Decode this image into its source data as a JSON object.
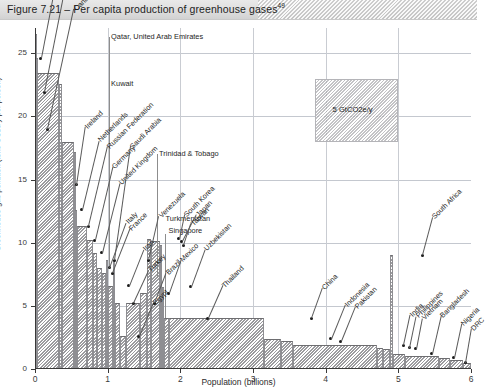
{
  "figure": {
    "title_prefix": "Figure 7.21",
    "title": "Figure 7.21 – Per capita production of greenhouse gases",
    "footnote_marker": "49"
  },
  "axes": {
    "x_title": "Population (billions)",
    "y_title": "Greenhouse-gas pollution (tons CO2e/y per person)",
    "x_ticks": [
      "0",
      "1",
      "2",
      "3",
      "4",
      "5",
      "6"
    ],
    "y_ticks": [
      "0",
      "5",
      "10",
      "15",
      "20",
      "25"
    ],
    "xlim": [
      0,
      6
    ],
    "ylim": [
      0,
      27
    ]
  },
  "annotation_box": {
    "label": "5 GtCO2e/y",
    "x_start": 3.85,
    "x_end": 5.0,
    "y_bottom": 18.0,
    "y_top": 23.0
  },
  "top_labels": [
    {
      "text": "Qatar, United Arab Emirates",
      "x": 1.02,
      "y": 26.3
    },
    {
      "text": "Kuwait",
      "x": 1.02,
      "y": 22.6
    },
    {
      "text": "Trinidad & Tobago",
      "x": 1.68,
      "y": 17.0
    },
    {
      "text": "Turkmenistan",
      "x": 1.77,
      "y": 11.9
    },
    {
      "text": "Singapore",
      "x": 1.81,
      "y": 10.9
    }
  ],
  "callouts": [
    {
      "name": "Australia",
      "x": 0.08,
      "y": 24.6,
      "tx": 0.36,
      "ty": 33.0
    },
    {
      "name": "United States of America",
      "x": 0.13,
      "y": 21.9,
      "tx": 0.46,
      "ty": 31.5
    },
    {
      "name": "Canada",
      "x": 0.17,
      "y": 19.0,
      "tx": 0.53,
      "ty": 28.5
    },
    {
      "name": "Ireland",
      "x": 0.57,
      "y": 14.6,
      "tx": 0.69,
      "ty": 19.2
    },
    {
      "name": "Netherlands",
      "x": 0.64,
      "y": 12.6,
      "tx": 0.87,
      "ty": 18.1
    },
    {
      "name": "Russian Federation",
      "x": 0.73,
      "y": 11.3,
      "tx": 0.99,
      "ty": 17.6
    },
    {
      "name": "Germany",
      "x": 0.82,
      "y": 10.2,
      "tx": 1.06,
      "ty": 16.0
    },
    {
      "name": "United Kingdom",
      "x": 0.92,
      "y": 9.2,
      "tx": 1.16,
      "ty": 14.7
    },
    {
      "name": "Saudi Arabia",
      "x": 1.09,
      "y": 8.6,
      "tx": 1.31,
      "ty": 17.6
    },
    {
      "name": "Italy",
      "x": 1.02,
      "y": 8.0,
      "tx": 1.25,
      "ty": 11.6
    },
    {
      "name": "France",
      "x": 1.06,
      "y": 7.6,
      "tx": 1.3,
      "ty": 11.1
    },
    {
      "name": "Iran",
      "x": 1.29,
      "y": 6.6,
      "tx": 1.49,
      "ty": 9.5
    },
    {
      "name": "Turkey",
      "x": 1.35,
      "y": 5.2,
      "tx": 1.56,
      "ty": 7.8
    },
    {
      "name": "Egypt",
      "x": 1.43,
      "y": 2.6,
      "tx": 1.62,
      "ty": 5.2
    },
    {
      "name": "Venezuela",
      "x": 1.56,
      "y": 8.6,
      "tx": 1.7,
      "ty": 12.1
    },
    {
      "name": "Brazil",
      "x": 1.64,
      "y": 5.2,
      "tx": 1.8,
      "ty": 7.6
    },
    {
      "name": "Mexico",
      "x": 1.84,
      "y": 6.0,
      "tx": 2.0,
      "ty": 8.6
    },
    {
      "name": "South Korea",
      "x": 1.98,
      "y": 10.3,
      "tx": 2.05,
      "ty": 12.2
    },
    {
      "name": "Japan",
      "x": 2.02,
      "y": 10.1,
      "tx": 2.21,
      "ty": 12.2
    },
    {
      "name": "Taiwan",
      "x": 2.04,
      "y": 9.8,
      "tx": 2.14,
      "ty": 11.5
    },
    {
      "name": "Uzbekistan",
      "x": 2.14,
      "y": 6.5,
      "tx": 2.33,
      "ty": 9.5
    },
    {
      "name": "Thailand",
      "x": 2.38,
      "y": 4.0,
      "tx": 2.58,
      "ty": 6.6
    },
    {
      "name": "China",
      "x": 3.8,
      "y": 4.0,
      "tx": 3.95,
      "ty": 6.4
    },
    {
      "name": "Indonesia",
      "x": 4.07,
      "y": 2.4,
      "tx": 4.26,
      "ty": 5.1
    },
    {
      "name": "Pakistan",
      "x": 4.21,
      "y": 2.2,
      "tx": 4.4,
      "ty": 4.9
    },
    {
      "name": "South Africa",
      "x": 5.33,
      "y": 9.0,
      "tx": 5.47,
      "ty": 12.0
    },
    {
      "name": "India",
      "x": 5.07,
      "y": 1.9,
      "tx": 5.16,
      "ty": 4.3
    },
    {
      "name": "Philippines",
      "x": 5.15,
      "y": 1.7,
      "tx": 5.24,
      "ty": 4.2
    },
    {
      "name": "Vietnam",
      "x": 5.24,
      "y": 1.6,
      "tx": 5.32,
      "ty": 4.0
    },
    {
      "name": "Bangladesh",
      "x": 5.46,
      "y": 1.2,
      "tx": 5.58,
      "ty": 4.2
    },
    {
      "name": "Nigeria",
      "x": 5.76,
      "y": 0.9,
      "tx": 5.86,
      "ty": 3.6
    },
    {
      "name": "DRC",
      "x": 5.92,
      "y": 0.5,
      "tx": 6.0,
      "ty": 3.2
    }
  ],
  "chart_data": {
    "type": "bar",
    "title": "Figure 7.21 – Per capita production of greenhouse gases",
    "xlabel": "Population (billions)",
    "ylabel": "Greenhouse-gas pollution (tons CO2e/y per person)",
    "xlim": [
      0,
      6
    ],
    "ylim": [
      0,
      27
    ],
    "grid": true,
    "legend": "none",
    "note": "Variable-width bar chart (Marimekko style): bar width = country population in billions, bar height = per-capita greenhouse-gas emissions in tons CO2e per year. Countries ordered by descending per-capita emissions; cumulative population on the x-axis.",
    "bars": [
      {
        "country": "Qatar, United Arab Emirates",
        "x_start": 0.0,
        "width": 0.006,
        "value": 26.5
      },
      {
        "country": "Kuwait",
        "x_start": 0.006,
        "width": 0.004,
        "value": 22.8
      },
      {
        "country": "Australia",
        "x_start": 0.01,
        "width": 0.021,
        "value": 24.6
      },
      {
        "country": "United States of America",
        "x_start": 0.031,
        "width": 0.303,
        "value": 23.4
      },
      {
        "country": "Canada",
        "x_start": 0.334,
        "width": 0.033,
        "value": 22.6
      },
      {
        "country": "Other high emitters",
        "x_start": 0.367,
        "width": 0.17,
        "value": 18.0
      },
      {
        "country": "Trinidad & Tobago",
        "x_start": 0.537,
        "width": 0.004,
        "value": 17.2
      },
      {
        "country": "Ireland",
        "x_start": 0.541,
        "width": 0.005,
        "value": 14.6
      },
      {
        "country": "Turkmenistan",
        "x_start": 0.546,
        "width": 0.006,
        "value": 12.0
      },
      {
        "country": "Singapore",
        "x_start": 0.552,
        "width": 0.005,
        "value": 11.1
      },
      {
        "country": "Netherlands",
        "x_start": 0.557,
        "width": 0.017,
        "value": 12.6
      },
      {
        "country": "Russian Federation",
        "x_start": 0.574,
        "width": 0.143,
        "value": 11.3
      },
      {
        "country": "Germany",
        "x_start": 0.717,
        "width": 0.082,
        "value": 10.2
      },
      {
        "country": "United Kingdom",
        "x_start": 0.799,
        "width": 0.061,
        "value": 9.2
      },
      {
        "country": "Italy",
        "x_start": 0.86,
        "width": 0.059,
        "value": 8.0
      },
      {
        "country": "France",
        "x_start": 0.919,
        "width": 0.061,
        "value": 7.6
      },
      {
        "country": "Saudi Arabia",
        "x_start": 0.98,
        "width": 0.025,
        "value": 8.6
      },
      {
        "country": "Iran",
        "x_start": 1.005,
        "width": 0.07,
        "value": 6.6
      },
      {
        "country": "Venezuela",
        "x_start": 1.075,
        "width": 0.027,
        "value": 8.6
      },
      {
        "country": "Turkey",
        "x_start": 1.102,
        "width": 0.073,
        "value": 5.2
      },
      {
        "country": "Egypt",
        "x_start": 1.175,
        "width": 0.075,
        "value": 2.6
      },
      {
        "country": "Brazil",
        "x_start": 1.25,
        "width": 0.19,
        "value": 5.2
      },
      {
        "country": "Mexico",
        "x_start": 1.44,
        "width": 0.106,
        "value": 6.0
      },
      {
        "country": "South Korea",
        "x_start": 1.546,
        "width": 0.048,
        "value": 10.3
      },
      {
        "country": "Japan",
        "x_start": 1.594,
        "width": 0.128,
        "value": 10.1
      },
      {
        "country": "Taiwan",
        "x_start": 1.722,
        "width": 0.023,
        "value": 9.8
      },
      {
        "country": "Uzbekistan",
        "x_start": 1.745,
        "width": 0.027,
        "value": 6.5
      },
      {
        "country": "Thailand",
        "x_start": 1.772,
        "width": 0.066,
        "value": 4.0
      },
      {
        "country": "China",
        "x_start": 1.838,
        "width": 1.32,
        "value": 4.0
      },
      {
        "country": "Indonesia",
        "x_start": 3.158,
        "width": 0.23,
        "value": 2.4
      },
      {
        "country": "Pakistan",
        "x_start": 3.388,
        "width": 0.165,
        "value": 2.2
      },
      {
        "country": "India",
        "x_start": 3.553,
        "width": 1.15,
        "value": 1.9
      },
      {
        "country": "Philippines",
        "x_start": 4.703,
        "width": 0.09,
        "value": 1.7
      },
      {
        "country": "Vietnam",
        "x_start": 4.793,
        "width": 0.086,
        "value": 1.6
      },
      {
        "country": "South Africa",
        "x_start": 4.879,
        "width": 0.049,
        "value": 9.0
      },
      {
        "country": "Bangladesh",
        "x_start": 4.928,
        "width": 0.158,
        "value": 1.2
      },
      {
        "country": "Other low emitters",
        "x_start": 5.086,
        "width": 0.47,
        "value": 1.0
      },
      {
        "country": "Nigeria",
        "x_start": 5.556,
        "width": 0.15,
        "value": 0.9
      },
      {
        "country": "Other",
        "x_start": 5.706,
        "width": 0.18,
        "value": 0.7
      },
      {
        "country": "DRC",
        "x_start": 5.886,
        "width": 0.114,
        "value": 0.5
      }
    ]
  }
}
